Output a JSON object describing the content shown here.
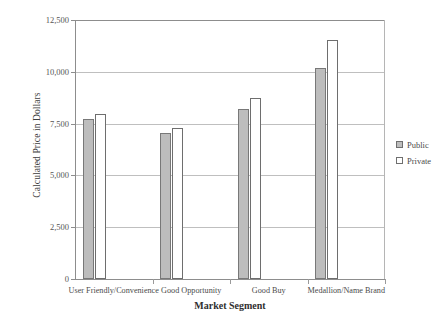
{
  "chart_data": {
    "type": "bar",
    "title": "",
    "xlabel": "Market Segment",
    "ylabel": "Calculated Price in Dollars",
    "categories": [
      "User Friendly/Convenience",
      "Good Opportunity",
      "Good Buy",
      "Medallion/Name Brand"
    ],
    "series": [
      {
        "name": "Public",
        "values": [
          7700,
          7050,
          8200,
          10200
        ]
      },
      {
        "name": "Private",
        "values": [
          7950,
          7300,
          8750,
          11550
        ]
      }
    ],
    "ylim": [
      0,
      12500
    ],
    "yticks": [
      0,
      2500,
      5000,
      7500,
      10000,
      12500
    ],
    "ytick_labels": [
      "0",
      "2,500",
      "5,000",
      "7,500",
      "10,000",
      "12,500"
    ],
    "grid": true,
    "legend_position": "right",
    "colors": {
      "public": "#bdbdbd",
      "private": "#ffffff",
      "bar_outline": "#787878",
      "gridline": "#bfbfbf",
      "axis": "#8d8d8d",
      "text": "#4b4b4b",
      "background": "#ffffff"
    }
  },
  "legend": {
    "items": [
      {
        "label": "Public",
        "swatch": "public"
      },
      {
        "label": "Private",
        "swatch": "private"
      }
    ]
  }
}
